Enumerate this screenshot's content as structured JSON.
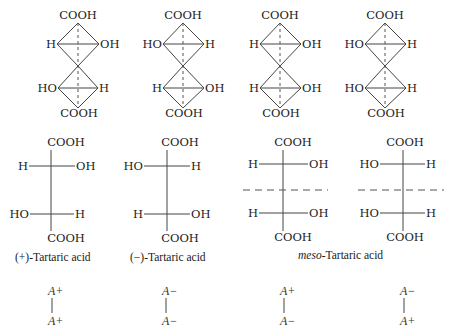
{
  "groups": {
    "cooh": "COOH",
    "h": "H",
    "oh": "OH",
    "ho": "HO"
  },
  "structures": [
    {
      "id": "plus",
      "name": "(+)-Tartaric acid",
      "top_center": {
        "left": "H",
        "right": "OH"
      },
      "bottom_center": {
        "left": "HO",
        "right": "H"
      },
      "configuration": {
        "top": "A+",
        "bottom": "A+"
      }
    },
    {
      "id": "minus",
      "name": "(−)-Tartaric acid",
      "top_center": {
        "left": "HO",
        "right": "H"
      },
      "bottom_center": {
        "left": "H",
        "right": "OH"
      },
      "configuration": {
        "top": "A−",
        "bottom": "A−"
      }
    },
    {
      "id": "meso-a",
      "name": "meso-Tartaric acid",
      "top_center": {
        "left": "H",
        "right": "OH"
      },
      "bottom_center": {
        "left": "H",
        "right": "OH"
      },
      "configuration": {
        "top": "A+",
        "bottom": "A−"
      }
    },
    {
      "id": "meso-b",
      "name": "meso-Tartaric acid",
      "top_center": {
        "left": "HO",
        "right": "H"
      },
      "bottom_center": {
        "left": "HO",
        "right": "H"
      },
      "configuration": {
        "top": "A−",
        "bottom": "A+"
      }
    }
  ],
  "labels": {
    "plus": "(+)-Tartaric acid",
    "minus": "(−)-Tartaric acid",
    "meso_prefix": "meso",
    "meso_suffix": "-Tartaric acid"
  }
}
